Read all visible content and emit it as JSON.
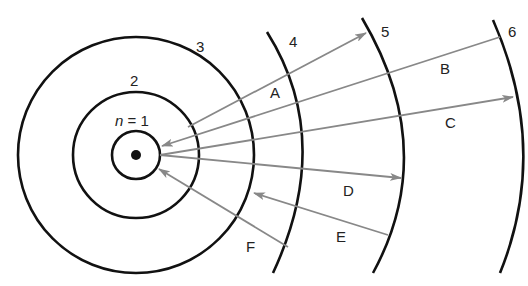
{
  "diagram": {
    "center": {
      "x": 136,
      "y": 155
    },
    "nucleus_label": "",
    "orbits": [
      {
        "n": 1,
        "label": "n = 1",
        "label_prefix": "n",
        "label_suffix": " = 1"
      },
      {
        "n": 2,
        "label": "2"
      },
      {
        "n": 3,
        "label": "3"
      },
      {
        "n": 4,
        "label": "4"
      },
      {
        "n": 5,
        "label": "5"
      },
      {
        "n": 6,
        "label": "6"
      }
    ],
    "transitions": [
      {
        "label": "A",
        "from_n": 2,
        "to_n": 5,
        "type": "absorption"
      },
      {
        "label": "B",
        "from_n": 6,
        "to_n": 1,
        "type": "emission"
      },
      {
        "label": "C",
        "from_n": 1,
        "to_n": 6,
        "type": "absorption"
      },
      {
        "label": "D",
        "from_n": 1,
        "to_n": 5,
        "type": "absorption"
      },
      {
        "label": "E",
        "from_n": 5,
        "to_n": 3,
        "type": "emission"
      },
      {
        "label": "F",
        "from_n": 4,
        "to_n": 1,
        "type": "emission"
      }
    ],
    "colors": {
      "orbit": "#111111",
      "arrow": "#888888",
      "background": "#ffffff"
    }
  }
}
